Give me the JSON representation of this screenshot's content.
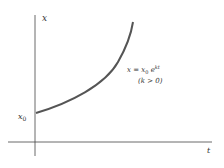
{
  "diagram": {
    "type": "exponential-growth-graph",
    "axes": {
      "vertical_label": "x",
      "horizontal_label": "t",
      "intercept_label": "x0"
    },
    "curve": {
      "equation_lhs": "x = x",
      "equation_sub": "0",
      "equation_exp_base": " e",
      "equation_exp": "kt",
      "condition": "(k > 0)",
      "color": "#555555"
    }
  }
}
